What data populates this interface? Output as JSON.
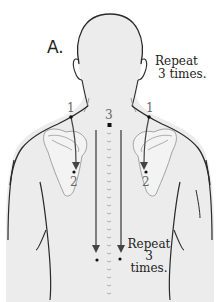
{
  "diagram": {
    "panel_label": "A.",
    "instructions": {
      "shoulder": {
        "line1": "Repeat",
        "line2": "3 times."
      },
      "spine": {
        "line1": "Repeat",
        "line2": "3",
        "line3": "times."
      }
    },
    "points": {
      "left_start": "1",
      "right_start": "1",
      "left_end": "2",
      "right_end": "2",
      "spine_start": "3"
    },
    "colors": {
      "skin_fill": "#ececec",
      "outline": "#2a2a2a",
      "scapula_outline": "#9a9a9a",
      "arrow": "#444444",
      "text": "#222222",
      "number": "#666666"
    }
  }
}
